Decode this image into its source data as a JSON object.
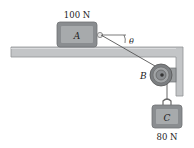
{
  "diagram": {
    "type": "mechanics-pulley-system",
    "blocks": [
      {
        "id": "A",
        "label": "A",
        "weight_label": "100 N"
      },
      {
        "id": "C",
        "label": "C",
        "weight_label": "80 N"
      }
    ],
    "pulley": {
      "label": "B"
    },
    "angle": {
      "label": "θ"
    }
  },
  "colors": {
    "surface": "#b9bbbd",
    "surface_edge": "#8f9294",
    "block_fill": "#8a8d90",
    "block_inner": "#a5a8aa",
    "rope": "#555555",
    "text": "#222222"
  }
}
